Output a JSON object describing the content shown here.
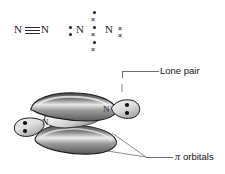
{
  "figure": {
    "background": "#ffffff"
  },
  "lewis_structure": {
    "name": "triple-bond-lewis",
    "left_atom": "N",
    "right_atom": "N",
    "bond_type": "triple",
    "bond_count": 3
  },
  "dot_cross_structure": {
    "name": "dot-cross-lewis",
    "left_atom": "N",
    "right_atom": "N",
    "left_lone_pair": {
      "glyph": "dot",
      "count": 2
    },
    "right_lone_pair": {
      "glyph": "cross",
      "symbol": "×",
      "count": 2
    },
    "shared_pairs": [
      {
        "dot": "•",
        "cross": "×"
      },
      {
        "dot": "•",
        "cross": "×"
      },
      {
        "dot": "•",
        "cross": "×"
      }
    ],
    "shared_pair_count": 3
  },
  "callouts": {
    "lone_pair": {
      "label": "Lone pair",
      "name": "lone-pair-callout"
    },
    "pi_orbitals": {
      "pi_symbol": "π",
      "label": "orbitals",
      "full_label": "π orbitals",
      "name": "pi-orbitals-callout"
    }
  },
  "orbital_diagram": {
    "name": "nitrogen-orbital-diagram",
    "atoms": [
      {
        "label": "N",
        "position": "left"
      },
      {
        "label": "N",
        "position": "right"
      }
    ],
    "lone_pairs": [
      {
        "position": "left",
        "electron_count": 2
      },
      {
        "position": "right",
        "electron_count": 2
      }
    ],
    "pi_orbitals": [
      {
        "position": "top"
      },
      {
        "position": "bottom"
      }
    ],
    "sigma_orbital": {
      "position": "center"
    }
  },
  "colors": {
    "text": "#111111",
    "atom_text": "#1a1a1a",
    "bond": "#2b2b2b",
    "leader_line": "#6e6e6e",
    "orbital_dark": "#3a3a3a",
    "orbital_mid": "#8a8a8a",
    "orbital_light": "#e8e8e8",
    "orbital_outline": "#1c1c1c",
    "background": "#ffffff"
  }
}
